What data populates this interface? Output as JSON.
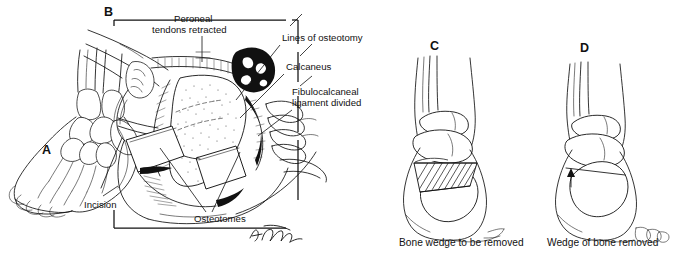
{
  "figure": {
    "background": "#ffffff",
    "ink_color": "#111111",
    "signature": "artist-signature"
  },
  "panels": [
    {
      "id": "A",
      "letter": "A",
      "subject": "oblique view of foot showing planned lateral incision",
      "callouts": [
        {
          "id": "incision",
          "text": "Incision"
        }
      ]
    },
    {
      "id": "B",
      "letter": "B",
      "subject": "operative exposure of the lateral calcaneus",
      "callouts": [
        {
          "id": "peroneal-tendons",
          "text": "Peroneal\ntendons retracted",
          "line1": "Peroneal",
          "line2": "tendons retracted"
        },
        {
          "id": "lines-of-osteotomy",
          "text": "Lines of osteotomy",
          "line1": "Lines of osteotomy",
          "line2": ""
        },
        {
          "id": "calcaneus",
          "text": "Calcaneus",
          "line1": "Calcaneus",
          "line2": ""
        },
        {
          "id": "fibulocalcaneal-ligament",
          "text": "Fibulocalcaneal\nligament divided",
          "line1": "Fibulocalcaneal",
          "line2": "ligament divided"
        },
        {
          "id": "osteotomes",
          "text": "Osteotomes",
          "line1": "Osteotomes",
          "line2": ""
        }
      ]
    },
    {
      "id": "C",
      "letter": "C",
      "subject": "posterior view of hindfoot with hatched bone wedge outlined",
      "caption": "Bone wedge to be removed"
    },
    {
      "id": "D",
      "letter": "D",
      "subject": "posterior view of hindfoot after wedge excision and closure",
      "caption": "Wedge of bone removed"
    }
  ]
}
